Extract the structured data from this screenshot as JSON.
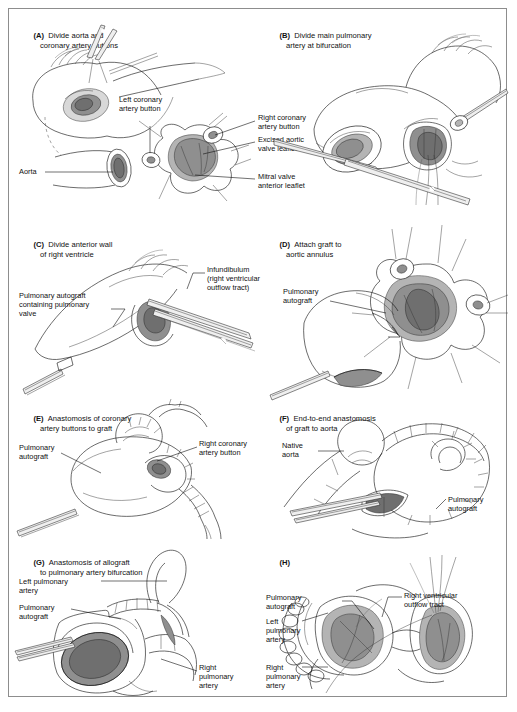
{
  "figure": {
    "kind": "surgical-illustration-plate",
    "procedure": "Ross procedure (pulmonary autograft aortic valve replacement)",
    "panel_count": 8,
    "frame_border_color": "#8d8d8d",
    "background_color": "#ffffff",
    "ink_color": "#111111",
    "shade_colors": [
      "#d8d8d8",
      "#b4b4b4",
      "#8f8f8f",
      "#6f6f6f"
    ]
  },
  "panels": [
    {
      "id": "A",
      "tag": "(A)",
      "title_line1": "Divide aorta and",
      "title_line2": "coronary artery buttons",
      "labels": [
        {
          "key": "aorta",
          "text_line1": "Aorta",
          "text_line2": ""
        },
        {
          "key": "left-coronary-artery-button",
          "text_line1": "Left coronary",
          "text_line2": "artery button"
        },
        {
          "key": "right-coronary-artery-button",
          "text_line1": "Right coronary",
          "text_line2": "artery button"
        },
        {
          "key": "excised-aortic-valve-leaflets",
          "text_line1": "Excised aortic",
          "text_line2": "valve leaflets"
        },
        {
          "key": "mitral-valve-anterior-leaflet",
          "text_line1": "Mitral valve",
          "text_line2": "anterior leaflet"
        }
      ]
    },
    {
      "id": "B",
      "tag": "(B)",
      "title_line1": "Divide main pulmonary",
      "title_line2": "artery at bifurcation",
      "labels": []
    },
    {
      "id": "C",
      "tag": "(C)",
      "title_line1": "Divide anterior wall",
      "title_line2": "of right ventricle",
      "labels": [
        {
          "key": "pulmonary-autograft-containing-pulmonary-valve",
          "text_line1": "Pulmonary autograft",
          "text_line2": "containing pulmonary",
          "text_line3": "valve"
        },
        {
          "key": "infundibulum-right-ventricular-outflow-tract",
          "text_line1": "Infundibulum",
          "text_line2": "(right ventricular",
          "text_line3": "outflow tract)"
        }
      ]
    },
    {
      "id": "D",
      "tag": "(D)",
      "title_line1": "Attach graft to",
      "title_line2": "aortic annulus",
      "labels": [
        {
          "key": "pulmonary-autograft",
          "text_line1": "Pulmonary",
          "text_line2": "autograft"
        }
      ]
    },
    {
      "id": "E",
      "tag": "(E)",
      "title_line1": "Anastomosis of coronary",
      "title_line2": "artery buttons to graft",
      "labels": [
        {
          "key": "pulmonary-autograft",
          "text_line1": "Pulmonary",
          "text_line2": "autograft"
        },
        {
          "key": "right-coronary-artery-button",
          "text_line1": "Right coronary",
          "text_line2": "artery button"
        }
      ]
    },
    {
      "id": "F",
      "tag": "(F)",
      "title_line1": "End-to-end anastomosis",
      "title_line2": "of graft to aorta",
      "labels": [
        {
          "key": "native-aorta",
          "text_line1": "Native",
          "text_line2": "aorta"
        },
        {
          "key": "pulmonary-autograft",
          "text_line1": "Pulmonary",
          "text_line2": "autograft"
        }
      ]
    },
    {
      "id": "G",
      "tag": "(G)",
      "title_line1": "Anastomosis of allograft",
      "title_line2": "to pulmonary artery bifurcation",
      "labels": [
        {
          "key": "left-pulmonary-artery",
          "text_line1": "Left pulmonary",
          "text_line2": "artery"
        },
        {
          "key": "pulmonary-autograft",
          "text_line1": "Pulmonary",
          "text_line2": "autograft"
        },
        {
          "key": "right-pulmonary-artery",
          "text_line1": "Right",
          "text_line2": "pulmonary",
          "text_line3": "artery"
        }
      ]
    },
    {
      "id": "H",
      "tag": "(H)",
      "title_line1": "",
      "title_line2": "",
      "labels": [
        {
          "key": "pulmonary-autograft",
          "text_line1": "Pulmonary",
          "text_line2": "autograft"
        },
        {
          "key": "left-pulmonary-artery",
          "text_line1": "Left",
          "text_line2": "pulmonary",
          "text_line3": "artery"
        },
        {
          "key": "right-pulmonary-artery",
          "text_line1": "Right",
          "text_line2": "pulmonary",
          "text_line3": "artery"
        },
        {
          "key": "right-ventricular-outflow-tract",
          "text_line1": "Right ventricular",
          "text_line2": "outflow tract"
        }
      ]
    }
  ]
}
